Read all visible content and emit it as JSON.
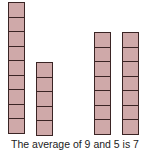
{
  "diagram": {
    "columns": [
      {
        "label": "9",
        "cells": 9,
        "left": 8
      },
      {
        "label": "5",
        "cells": 5,
        "left": 36
      },
      {
        "label": "7",
        "cells": 7,
        "left": 94
      },
      {
        "label": "7",
        "cells": 7,
        "left": 122
      }
    ],
    "cell_height": 15,
    "baseline_y": 137,
    "fill_color": "#cfa9a9",
    "border_color": "#3a2424"
  },
  "caption": "The average of 9 and 5 is 7"
}
